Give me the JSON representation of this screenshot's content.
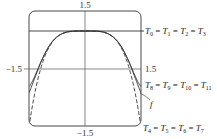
{
  "chart_data": {
    "type": "line",
    "title": "",
    "xlabel": "",
    "ylabel": "",
    "xlim": [
      -1.5,
      1.5
    ],
    "ylim": [
      -1.5,
      1.5
    ],
    "grid": false,
    "tick_labels": {
      "top": "1.5",
      "bottom": "−1.5",
      "left": "−1.5",
      "right": "1.5"
    },
    "series": [
      {
        "name": "f",
        "style": "solid",
        "function": "cos(x^2)"
      },
      {
        "name": "T0 = T1 = T2 = T3",
        "style": "solid",
        "function": "1"
      },
      {
        "name": "T4 = T5 = T6 = T7",
        "style": "dashed",
        "function": "1 - x^4/2"
      },
      {
        "name": "T8 = T9 = T10 = T11",
        "style": "solid",
        "function": "1 - x^4/2 + x^8/24"
      }
    ],
    "annotations": [
      {
        "text": "T0 = T1 = T2 = T3",
        "position": "right, y=1"
      },
      {
        "text": "T8 = T9 = T10 = T11",
        "position": "right, lower-middle"
      },
      {
        "text": "f",
        "position": "right, arrow to curve"
      },
      {
        "text": "T4 = T5 = T6 = T7",
        "position": "bottom-right"
      }
    ]
  },
  "labels": {
    "tick_top": "1.5",
    "tick_bottom": "−1.5",
    "tick_left": "−1.5",
    "tick_right": "1.5",
    "t0": {
      "a": "T",
      "as": "0",
      "b": "T",
      "bs": "1",
      "c": "T",
      "cs": "2",
      "d": "T",
      "ds": "3"
    },
    "t8": {
      "a": "T",
      "as": "8",
      "b": "T",
      "bs": "9",
      "c": "T",
      "cs": "10",
      "d": "T",
      "ds": "11"
    },
    "t4": {
      "a": "T",
      "as": "4",
      "b": "T",
      "bs": "5",
      "c": "T",
      "cs": "6",
      "d": "T",
      "ds": "7"
    },
    "f": "f",
    "eq": "="
  }
}
